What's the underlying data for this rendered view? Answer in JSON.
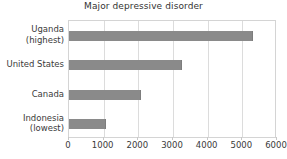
{
  "chart_data": {
    "type": "bar",
    "orientation": "horizontal",
    "title": "Major depressive disorder",
    "xlabel": "",
    "ylabel": "",
    "categories": [
      "Uganda\n(highest)",
      "United States",
      "Canada",
      "Indonesia\n(lowest)"
    ],
    "category_lines": [
      [
        "Uganda",
        "(highest)"
      ],
      [
        "United States"
      ],
      [
        "Canada"
      ],
      [
        "Indonesia",
        "(lowest)"
      ]
    ],
    "values": [
      5300,
      3250,
      2080,
      1070
    ],
    "xlim": [
      0,
      6000
    ],
    "xticks": [
      0,
      1000,
      2000,
      3000,
      4000,
      5000,
      6000
    ],
    "xtick_labels": [
      "0",
      "1000",
      "2000",
      "3000",
      "4000",
      "5000",
      "6000"
    ],
    "grid": "vertical",
    "legend": "none",
    "colors": {
      "bar": "#8a8a8a",
      "bar_edge": "#7d7d7d",
      "plot_background": "#ffffff",
      "gridline": "#dcdcdc",
      "border": "#d4d4d4",
      "text": "#3a3a3a",
      "title_text": "#333333"
    }
  }
}
